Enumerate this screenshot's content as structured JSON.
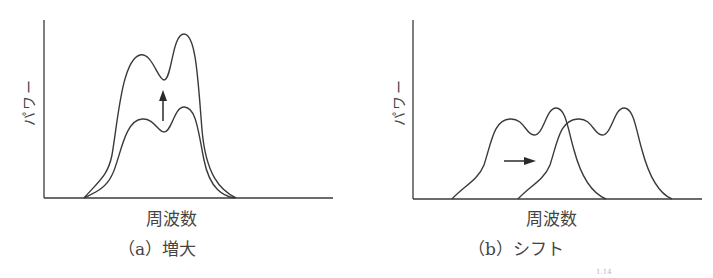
{
  "panels": [
    {
      "id": "a",
      "ylabel": "パワー",
      "xlabel": "周波数",
      "caption": "（a）増大",
      "annotation": "up-arrow"
    },
    {
      "id": "b",
      "ylabel": "パワー",
      "xlabel": "周波数",
      "caption": "（b）シフト",
      "annotation": "right-arrow"
    }
  ],
  "ref_mark": "1.14",
  "colors": {
    "line": "#3a3a3a",
    "background": "#ffffff"
  }
}
